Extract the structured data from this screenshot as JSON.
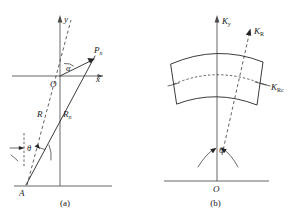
{
  "figure": {
    "title_text": "",
    "line_color": "#262626",
    "axis_color": "#555555",
    "background": "#ffffff"
  },
  "panel_a": {
    "caption": "(a)",
    "labels": {
      "y_axis": "y",
      "x_axis": "x",
      "origin": "O",
      "point_pn_base": "P",
      "point_pn_sub": "n",
      "radius_r": "R",
      "radius_rn_base": "R",
      "radius_rn_sub": "n",
      "angle_alpha": "α",
      "angle_theta": "θ",
      "point_a": "A"
    },
    "icons": {
      "y_axis_arrow": "arrow-up-icon",
      "x_axis_arrow": "arrow-right-icon",
      "pn_vector_arrow": "arrow-vector-icon",
      "theta_arrow": "arrow-right-small-icon"
    }
  },
  "panel_b": {
    "caption": "(b)",
    "labels": {
      "ky_axis_base": "K",
      "ky_axis_sub": "y",
      "kr_axis_base": "K",
      "kr_axis_sub": "R",
      "krc_base": "K",
      "krc_sub": "Rc",
      "angle_theta": "θ",
      "origin": "O"
    },
    "icons": {
      "ky_axis_arrow": "arrow-up-icon",
      "kr_axis_arrow": "arrow-up-right-icon",
      "theta_arc_arrows": "double-arc-arrow-icon",
      "sector_shape": "curved-sector-icon"
    }
  }
}
